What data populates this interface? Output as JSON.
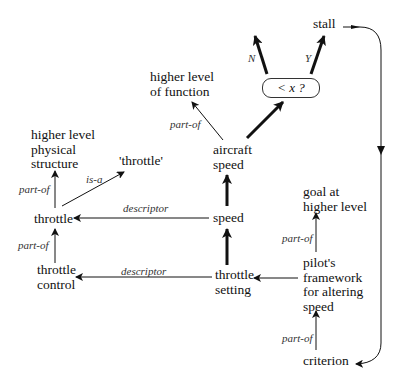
{
  "nodes": {
    "stall": "stall",
    "decision": "< x ?",
    "higher_level_function": [
      "higher level",
      "of function"
    ],
    "aircraft_speed": [
      "aircraft",
      "speed"
    ],
    "speed": "speed",
    "throttle_setting": [
      "throttle",
      "setting"
    ],
    "pilots_framework": [
      "pilot's",
      "framework",
      "for altering",
      "speed"
    ],
    "goal_higher_level": [
      "goal at",
      "higher level"
    ],
    "criterion": "criterion",
    "higher_level_physical_structure": [
      "higher level",
      "physical",
      "structure"
    ],
    "throttle_quoted": "'throttle'",
    "throttle": "throttle",
    "throttle_control": [
      "throttle",
      "control"
    ]
  },
  "edge_labels": {
    "n": "N",
    "y": "Y",
    "part_of_function": "part-of",
    "descriptor_speed": "descriptor",
    "descriptor_setting": "descriptor",
    "part_of_goal": "part-of",
    "part_of_criterion": "part-of",
    "part_of_structure": "part-of",
    "is_a": "is-a",
    "part_of_control": "part-of"
  }
}
